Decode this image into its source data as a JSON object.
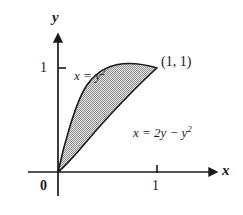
{
  "figure": {
    "kind": "math-diagram",
    "background_color": "#ffffff",
    "ink_color": "#1a1a1a"
  },
  "axes": {
    "x_axis_label": "x",
    "y_axis_label": "y",
    "origin_label": "0",
    "x_ticks": [
      {
        "value": 1,
        "label": "1"
      }
    ],
    "y_ticks": [
      {
        "value": 1,
        "label": "1"
      }
    ],
    "x_range": [
      -0.2,
      1.45
    ],
    "y_range": [
      -0.25,
      1.45
    ],
    "arrowheads": [
      "x-positive",
      "y-positive"
    ]
  },
  "curves": [
    {
      "name": "left-boundary",
      "label_text": "x = y",
      "label_exponent": "2",
      "equation": "x = y^2",
      "stroke": "#1a1a1a"
    },
    {
      "name": "right-boundary",
      "label_text": "x = 2y − y",
      "label_exponent": "2",
      "equation": "x = 2y - y^2",
      "stroke": "#1a1a1a"
    }
  ],
  "annotations": {
    "intersection_point_label": "(1, 1)",
    "intersection_point": [
      1,
      1
    ],
    "origin_point": [
      0,
      0
    ]
  },
  "region": {
    "name": "shaded-region",
    "fill_pattern": "gray-stipple",
    "fill_color": "#a8a8a8",
    "border_color": "#1a1a1a"
  }
}
